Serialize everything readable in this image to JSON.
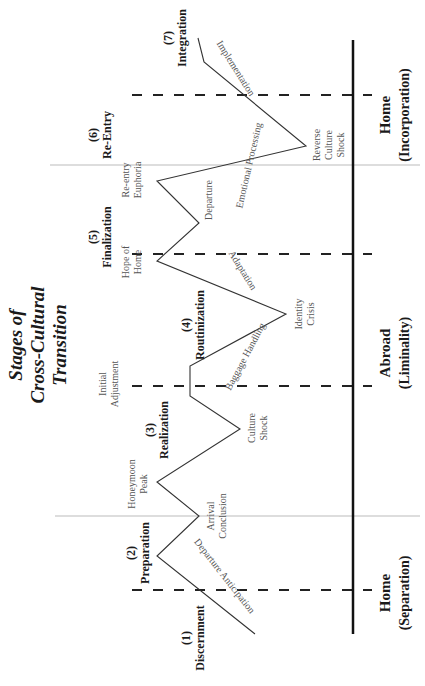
{
  "title": {
    "line1": "Stages of",
    "line2": "Cross-Cultural",
    "line3": "Transition"
  },
  "stages": [
    {
      "num": "(1)",
      "name": "Discernment"
    },
    {
      "num": "(2)",
      "name": "Preparation"
    },
    {
      "num": "(3)",
      "name": "Realization"
    },
    {
      "num": "(4)",
      "name": "Routinization"
    },
    {
      "num": "(5)",
      "name": "Finalization"
    },
    {
      "num": "(6)",
      "name": "Re-Entry"
    },
    {
      "num": "(7)",
      "name": "Integration"
    }
  ],
  "points": {
    "arrival_conclusion": [
      "Arrival",
      "Conclusion"
    ],
    "honeymoon_peak": [
      "Honeymoon",
      "Peak"
    ],
    "culture_shock": [
      "Culture",
      "Shock"
    ],
    "initial_adjustment": [
      "Initial",
      "Adjustment"
    ],
    "identity_crisis": [
      "Identity",
      "Crisis"
    ],
    "hope_of_home": [
      "Hope of",
      "Home"
    ],
    "departure": [
      "Departure"
    ],
    "reentry_euphoria": [
      "Re-entry",
      "Euphoria"
    ],
    "reverse_culture_shock": [
      "Reverse",
      "Culture",
      "Shock"
    ]
  },
  "segments": {
    "departure_anticipation": "Departure Anticipation",
    "baggage_handling": "Baggage Handling",
    "adaptation": "Adaptation",
    "emotional_processing": "Emotional Processing",
    "implementation": "Implementation"
  },
  "regions": [
    {
      "main": "Home",
      "sub": "(Separation)"
    },
    {
      "main": "Abroad",
      "sub": "(Liminality)"
    },
    {
      "main": "Home",
      "sub": "(Incorporation)"
    }
  ],
  "colors": {
    "line": "#333333",
    "dash": "#222222",
    "divider": "#bbbbbb",
    "baseline": "#111111"
  }
}
